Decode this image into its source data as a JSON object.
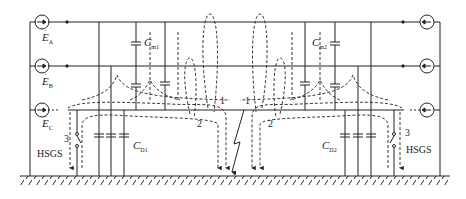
{
  "diagram": {
    "type": "three-phase line single-phase-to-ground fault circuit with high-speed grounding switches",
    "sources": {
      "left": [
        {
          "label": "E",
          "subscript": "A"
        },
        {
          "label": "E",
          "subscript": "B"
        },
        {
          "label": "E",
          "subscript": "C"
        }
      ],
      "right_count": 3
    },
    "capacitors": {
      "cm1": {
        "label": "C",
        "subscript": "m1"
      },
      "cm2": {
        "label": "C",
        "subscript": "m2"
      },
      "cd1": {
        "label": "C",
        "subscript": "D1"
      },
      "cd2": {
        "label": "C",
        "subscript": "D2"
      }
    },
    "switches": {
      "left": {
        "label": "HSGS",
        "path_number": "3"
      },
      "right": {
        "label": "HSGS",
        "path_number": "3"
      }
    },
    "current_paths": {
      "left_1": "1",
      "left_2": "2",
      "right_1": "1",
      "right_2": "2"
    },
    "colors": {
      "line": "#222222",
      "background": "#ffffff"
    }
  }
}
